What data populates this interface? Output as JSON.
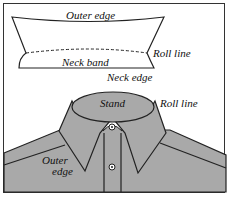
{
  "diagram": {
    "type": "shirt-collar-illustration",
    "top_panel": {
      "labels": {
        "outer_edge": "Outer edge",
        "roll_line": "Roll line",
        "neck_band": "Neck band",
        "neck_edge": "Neck edge"
      }
    },
    "bottom_panel": {
      "labels": {
        "stand": "Stand",
        "roll_line": "Roll line",
        "outer_edge_line1": "Outer",
        "outer_edge_line2": "edge"
      }
    },
    "colors": {
      "fabric_fill": "#a9a9a9",
      "outline": "#222222",
      "background": "#ffffff"
    }
  }
}
